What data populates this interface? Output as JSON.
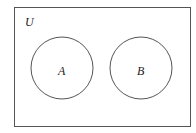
{
  "diagram": {
    "type": "venn",
    "universe_label": "U",
    "sets": [
      {
        "label": "A"
      },
      {
        "label": "B"
      }
    ],
    "relationship": "disjoint",
    "stroke_color": "#555555",
    "background": "#ffffff"
  }
}
